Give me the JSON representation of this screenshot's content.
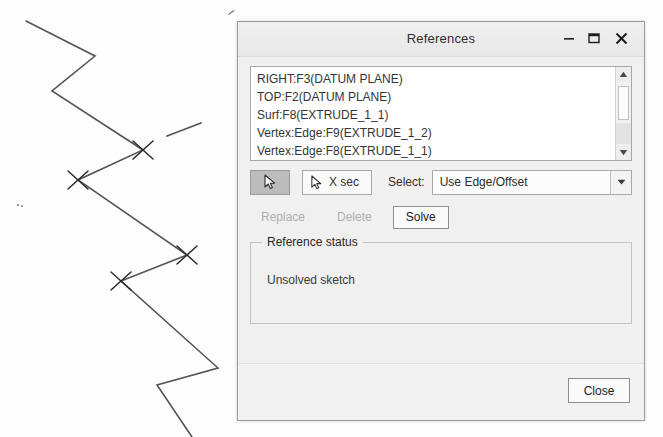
{
  "dialog": {
    "title": "References",
    "window_controls": {
      "minimize": "minimize-icon",
      "maximize": "maximize-icon",
      "close": "close-icon"
    },
    "references_list": [
      "RIGHT:F3(DATUM PLANE)",
      "TOP:F2(DATUM PLANE)",
      "Surf:F8(EXTRUDE_1_1)",
      "Vertex:Edge:F9(EXTRUDE_1_2)",
      "Vertex:Edge:F8(EXTRUDE_1_1)"
    ],
    "toolbar": {
      "select_arrow_icon": "cursor-arrow-icon",
      "select_arrow_pressed": true,
      "xsec_icon": "cursor-arrow-icon",
      "xsec_label": "X sec",
      "select_label": "Select:",
      "select_value": "Use Edge/Offset",
      "select_arrow_down_icon": "chevron-down-icon"
    },
    "actions": [
      {
        "label": "Replace",
        "enabled": false
      },
      {
        "label": "Delete",
        "enabled": false
      },
      {
        "label": "Solve",
        "enabled": true
      }
    ],
    "reference_status": {
      "legend": "Reference status",
      "message": "Unsolved sketch"
    },
    "footer": {
      "close_label": "Close"
    },
    "colors": {
      "window_bg": "#f0f0f0",
      "title_bar": "#ececec",
      "border": "#9b9b9b",
      "list_bg": "#ffffff",
      "text": "#2d2d2d",
      "disabled_text": "#aeaeae",
      "pressed_button_bg": "#bcbcbc"
    }
  },
  "sketch": {
    "stroke_color": "#555555",
    "marker_color": "#2b2b2b",
    "polyline_points": "26,21 95,56 52,91 143,150 78,180 187,255 121,281 218,368 157,385 192,437",
    "detached_segment": {
      "x1": 167,
      "y1": 136,
      "x2": 201,
      "y2": 123
    },
    "vertex_markers": [
      {
        "x": 143,
        "y": 150
      },
      {
        "x": 78,
        "y": 180
      },
      {
        "x": 187,
        "y": 255
      },
      {
        "x": 121,
        "y": 281
      }
    ],
    "speck_marks": [
      {
        "x": 18,
        "y": 205
      },
      {
        "x": 231,
        "y": 15
      }
    ]
  }
}
